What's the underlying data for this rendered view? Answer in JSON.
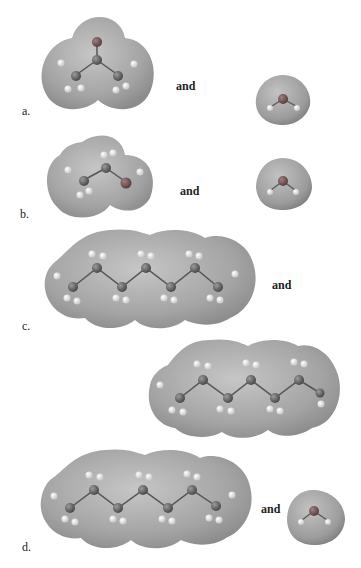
{
  "panels": [
    {
      "letter": "a.",
      "and": "and",
      "left": "acetone",
      "right": "water"
    },
    {
      "letter": "b.",
      "and": "and",
      "left": "ethanol",
      "right": "water"
    },
    {
      "letter": "c.",
      "and": "and",
      "left": "heptane",
      "right": "heptane"
    },
    {
      "letter": "d.",
      "and": "and",
      "left": "heptane",
      "right": "water"
    }
  ],
  "atoms": {
    "H": "H",
    "C": "C",
    "O": "O"
  },
  "colors": {
    "surface": "#a8a8a8",
    "surface_dark": "#8a8a8a",
    "surface_light": "#c8c8c8",
    "carbon": "#6e6e6e",
    "oxygen": "#7a5f5f",
    "hydrogen": "#e8e8e8"
  }
}
